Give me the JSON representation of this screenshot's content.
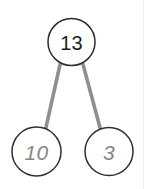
{
  "diagram": {
    "type": "number-bond",
    "background_color": "#ffffff",
    "connector_color": "#8f8f8f",
    "root_stroke_color": "#2b2b2b",
    "child_stroke_color": "#2f2f2f",
    "root_text_color": "#1d1d1d",
    "child_text_color": "#868686",
    "hairline_color": "#ededed",
    "root": {
      "label": "13",
      "cx": 71.5,
      "cy": 42,
      "r": 23.5
    },
    "children": [
      {
        "label": "10",
        "cx": 36.5,
        "cy": 151.5,
        "r": 24.5
      },
      {
        "label": "3",
        "cx": 109,
        "cy": 151.5,
        "r": 24
      }
    ],
    "connectors": [
      {
        "x1": 60.5,
        "y1": 62.5,
        "x2": 45.5,
        "y2": 129.5
      },
      {
        "x1": 82.5,
        "y1": 62.5,
        "x2": 100.5,
        "y2": 129.5
      }
    ]
  }
}
